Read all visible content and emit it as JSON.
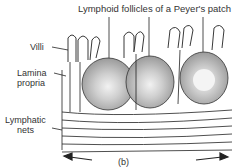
{
  "labels": {
    "title": "Lymphoid follicles of a Peyer's patch",
    "villi": "Villi",
    "lamina_1": "Lamina",
    "lamina_2": "propria",
    "lymph_1": "Lymphatic",
    "lymph_2": "nets",
    "caption": "(b)"
  },
  "colors": {
    "ink": "#222222",
    "follicle": "#9a9a9a",
    "center": "#e4e4e4"
  }
}
